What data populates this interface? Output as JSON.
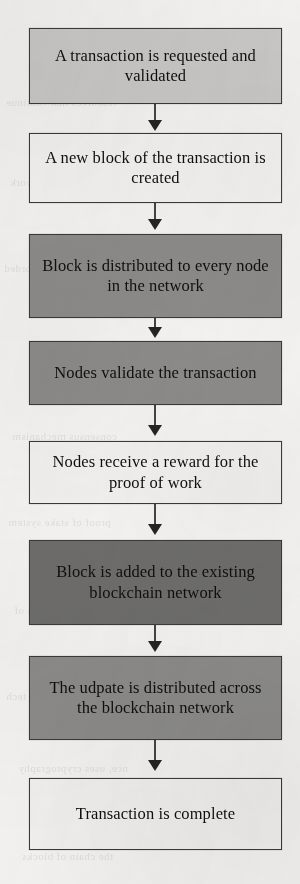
{
  "diagram": {
    "type": "vertical-flowchart",
    "background_color": "#f4f3f1",
    "border_color": "#3a3a38",
    "connector_color": "#46443f",
    "nodes": [
      {
        "id": "node-1",
        "label": "A transaction is requested and validated",
        "fill": "#c9c8c6",
        "top": 28,
        "height": 76
      },
      {
        "id": "node-2",
        "label": "A new block of the transaction is created",
        "fill": "#f3f2f0",
        "top": 133,
        "height": 70
      },
      {
        "id": "node-3",
        "label": "Block is distributed to every node in the network",
        "fill": "#8c8b89",
        "top": 234,
        "height": 84
      },
      {
        "id": "node-4",
        "label": "Nodes validate the transaction",
        "fill": "#8c8b89",
        "top": 341,
        "height": 64
      },
      {
        "id": "node-5",
        "label": "Nodes receive a reward for the proof of work",
        "fill": "#f1f0ee",
        "top": 441,
        "height": 63
      },
      {
        "id": "node-6",
        "label": "Block is added to the existing blockchain network",
        "fill": "#6e6d6b",
        "top": 540,
        "height": 85
      },
      {
        "id": "node-7",
        "label": "The udpate is distributed across the blockchain network",
        "fill": "#8c8b89",
        "top": 656,
        "height": 84
      },
      {
        "id": "node-8",
        "label": "Transaction is complete",
        "fill": "#f1f0ee",
        "top": 778,
        "height": 72
      }
    ],
    "arrows": [
      {
        "id": "arrow-1-2",
        "from": "node-1",
        "to": "node-2",
        "line_top": 104,
        "line_height": 18,
        "head_top": 120
      },
      {
        "id": "arrow-2-3",
        "from": "node-2",
        "to": "node-3",
        "line_top": 203,
        "line_height": 17,
        "head_top": 219
      },
      {
        "id": "arrow-3-4",
        "from": "node-3",
        "to": "node-4",
        "line_top": 318,
        "line_height": 12,
        "head_top": 327
      },
      {
        "id": "arrow-4-5",
        "from": "node-4",
        "to": "node-5",
        "line_top": 405,
        "line_height": 21,
        "head_top": 425
      },
      {
        "id": "arrow-5-6",
        "from": "node-5",
        "to": "node-6",
        "line_top": 504,
        "line_height": 21,
        "head_top": 524
      },
      {
        "id": "arrow-6-7",
        "from": "node-6",
        "to": "node-7",
        "line_top": 625,
        "line_height": 18,
        "head_top": 641
      },
      {
        "id": "arrow-7-8",
        "from": "node-7",
        "to": "node-8",
        "line_top": 740,
        "line_height": 21,
        "head_top": 760
      }
    ]
  },
  "bleed_through": [
    {
      "text": "resources that continue",
      "left": 6,
      "top": 96
    },
    {
      "text": "a ledger of the network",
      "left": 10,
      "top": 176
    },
    {
      "text": "the data is recorded",
      "left": 4,
      "top": 262
    },
    {
      "text": "consensus mechanism",
      "left": 12,
      "top": 430
    },
    {
      "text": "proof of stake system",
      "left": 8,
      "top": 516
    },
    {
      "text": "immutable records of",
      "left": 14,
      "top": 604
    },
    {
      "text": "distributed ledger tech",
      "left": 6,
      "top": 690
    },
    {
      "text": "nce, uses cryptography",
      "left": 18,
      "top": 762
    },
    {
      "text": "the chain of blocks",
      "left": 22,
      "top": 850
    }
  ]
}
